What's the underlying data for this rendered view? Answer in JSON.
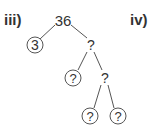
{
  "labels": {
    "left": "iii)",
    "right": "iv)"
  },
  "tree": {
    "root": "36",
    "nodes": [
      {
        "id": "root",
        "text": "36",
        "circled": false,
        "x": 63,
        "y": 20,
        "size": 15
      },
      {
        "id": "n3",
        "text": "3",
        "circled": true,
        "x": 35,
        "y": 45,
        "size": 14
      },
      {
        "id": "q1",
        "text": "?",
        "circled": false,
        "x": 91,
        "y": 45,
        "size": 14
      },
      {
        "id": "q2",
        "text": "?",
        "circled": true,
        "x": 73,
        "y": 78,
        "size": 13
      },
      {
        "id": "q3",
        "text": "?",
        "circled": false,
        "x": 105,
        "y": 78,
        "size": 14
      },
      {
        "id": "q4",
        "text": "?",
        "circled": true,
        "x": 90,
        "y": 116,
        "size": 13
      },
      {
        "id": "q5",
        "text": "?",
        "circled": true,
        "x": 118,
        "y": 116,
        "size": 13
      }
    ],
    "edges": [
      {
        "from": "root",
        "to": "n3",
        "x1": 55,
        "y1": 25,
        "x2": 40,
        "y2": 39
      },
      {
        "from": "root",
        "to": "q1",
        "x1": 71,
        "y1": 25,
        "x2": 87,
        "y2": 38
      },
      {
        "from": "q1",
        "to": "q2",
        "x1": 87,
        "y1": 52,
        "x2": 78,
        "y2": 70
      },
      {
        "from": "q1",
        "to": "q3",
        "x1": 94,
        "y1": 52,
        "x2": 102,
        "y2": 70
      },
      {
        "from": "q3",
        "to": "q4",
        "x1": 101,
        "y1": 85,
        "x2": 94,
        "y2": 108
      },
      {
        "from": "q3",
        "to": "q5",
        "x1": 108,
        "y1": 85,
        "x2": 114,
        "y2": 108
      }
    ],
    "circle_radius": 8,
    "stroke_color": "#555555"
  }
}
